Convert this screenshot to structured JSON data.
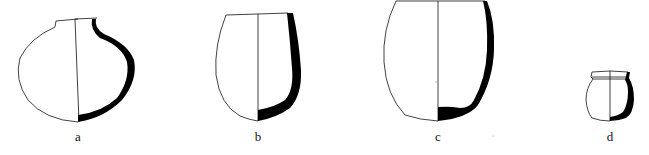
{
  "figure": {
    "type": "pottery profile drawings",
    "colors": {
      "outline": "#111111",
      "section": "#000000",
      "background": "#ffffff"
    },
    "vessels": [
      {
        "id": "a",
        "label": "a",
        "shape": "globular jar with short neck"
      },
      {
        "id": "b",
        "label": "b",
        "shape": "ovoid deep bowl"
      },
      {
        "id": "c",
        "label": "c",
        "shape": "barrel-shaped deep vessel with flat base"
      },
      {
        "id": "d",
        "label": "d",
        "shape": "small jar with everted rim"
      }
    ]
  }
}
